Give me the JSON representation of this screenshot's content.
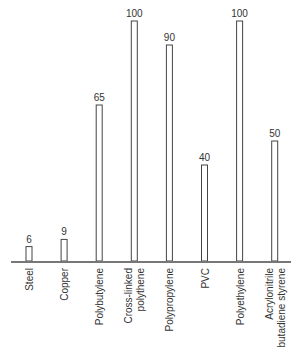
{
  "chart_data": {
    "type": "bar",
    "title": "",
    "xlabel": "",
    "ylabel": "",
    "ylim": [
      0,
      100
    ],
    "grid": false,
    "categories": [
      [
        "Steel"
      ],
      [
        "Copper"
      ],
      [
        "Polybutylene"
      ],
      [
        "Cross-linked",
        "polythene"
      ],
      [
        "Polypropylene"
      ],
      [
        "PVC"
      ],
      [
        "Polyethylene"
      ],
      [
        "Acrylonitrile",
        "butadiene styrene"
      ]
    ],
    "values": [
      6,
      9,
      65,
      100,
      90,
      40,
      100,
      50
    ],
    "data_labels": [
      "6",
      "9",
      "65",
      "100",
      "90",
      "40",
      "100",
      "50"
    ]
  }
}
